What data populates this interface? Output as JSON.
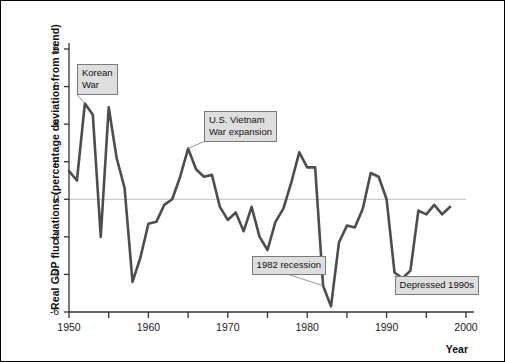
{
  "chart_data": {
    "type": "line",
    "title": "",
    "subtitle": "",
    "xlabel": "Year",
    "ylabel": "Real GDP fluctuations (percentage deviation from trend)",
    "xlim": [
      1950,
      2000
    ],
    "ylim": [
      -6,
      8
    ],
    "xticks": [
      1950,
      1960,
      1970,
      1980,
      1990,
      2000
    ],
    "xtick_labels": [
      "1950",
      "1960",
      "1970",
      "1980",
      "1990",
      "2000"
    ],
    "xminor_ticks": [
      1955,
      1965,
      1975,
      1985,
      1995
    ],
    "yticks": [
      -6,
      -4,
      -2,
      0,
      2,
      4,
      6,
      8
    ],
    "ytick_labels": [
      "-6",
      "-4",
      "-2",
      "0",
      "2",
      "4",
      "6",
      "8"
    ],
    "grid": false,
    "zero_line": true,
    "legend_position": "none",
    "series": [
      {
        "name": "Real GDP deviation from trend",
        "color": "#4d4d4d",
        "x": [
          1950,
          1951,
          1952,
          1953,
          1954,
          1955,
          1956,
          1957,
          1958,
          1959,
          1960,
          1961,
          1962,
          1963,
          1964,
          1965,
          1966,
          1967,
          1968,
          1969,
          1970,
          1971,
          1972,
          1973,
          1974,
          1975,
          1976,
          1977,
          1978,
          1979,
          1980,
          1981,
          1982,
          1983,
          1984,
          1985,
          1986,
          1987,
          1988,
          1989,
          1990,
          1991,
          1992,
          1993,
          1994,
          1995,
          1996,
          1997,
          1998
        ],
        "y": [
          1.5,
          1.0,
          5.1,
          4.5,
          -2.0,
          4.9,
          2.2,
          0.6,
          -4.4,
          -3.1,
          -1.3,
          -1.2,
          -0.3,
          0.0,
          1.2,
          2.7,
          1.6,
          1.2,
          1.3,
          -0.4,
          -1.1,
          -0.7,
          -1.7,
          -0.4,
          -2.0,
          -2.7,
          -1.2,
          -0.5,
          0.9,
          2.5,
          1.7,
          1.7,
          -4.6,
          -5.7,
          -2.3,
          -1.4,
          -1.5,
          -0.5,
          1.4,
          1.2,
          0.0,
          -3.9,
          -4.2,
          -3.8,
          -0.6,
          -0.8,
          -0.3,
          -0.8,
          -0.4
        ]
      }
    ],
    "annotations": [
      {
        "text": "Korean\nWar",
        "label_x": 1951,
        "label_y": 6.4,
        "point_x": 1952,
        "point_y": 5.1
      },
      {
        "text": "U.S. Vietnam\nWar expansion",
        "label_x": 1967,
        "label_y": 3.9,
        "point_x": 1965,
        "point_y": 2.7
      },
      {
        "text": "1982 recession",
        "label_x": 1973,
        "label_y": -3.5,
        "point_x": 1982,
        "point_y": -4.6
      },
      {
        "text": "Depressed 1990s",
        "label_x": 1991,
        "label_y": -4.6,
        "point_x": 1992,
        "point_y": -4.2
      }
    ],
    "axis_colors": {
      "axis": "#333333",
      "zero_line": "#cccccc",
      "line": "#4d4d4d",
      "annotation_bg": "#dedede",
      "annotation_border": "#7a7a7a"
    }
  }
}
